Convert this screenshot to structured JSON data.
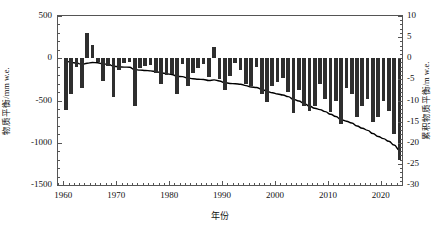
{
  "axes": {
    "left": {
      "label": "物质平衡/mm w.e.",
      "ticks": [
        "500",
        "0",
        "-500",
        "-1000",
        "-1500"
      ],
      "values": [
        500,
        0,
        -500,
        -1000,
        -1500
      ],
      "min": -1500,
      "max": 500
    },
    "right": {
      "label": "累积物质平衡/m w.e.",
      "ticks": [
        "10",
        "5",
        "0",
        "-5",
        "-10",
        "-15",
        "-20",
        "-25",
        "-30"
      ],
      "values": [
        10,
        5,
        0,
        -5,
        -10,
        -15,
        -20,
        -25,
        -30
      ],
      "min": -30,
      "max": 10
    },
    "bottom": {
      "label": "年份",
      "ticks": [
        "1960",
        "1970",
        "1980",
        "1990",
        "2000",
        "2010",
        "2020"
      ],
      "values": [
        1960,
        1970,
        1980,
        1990,
        2000,
        2010,
        2020
      ],
      "min": 1959,
      "max": 2024
    }
  },
  "style": {
    "bar_color": "#2e2e2e",
    "line_color": "#000000",
    "axis_color": "#555555",
    "background": "#ffffff"
  },
  "chart_data": {
    "type": "bar",
    "title": "",
    "subtitle": "",
    "xlabel": "年份",
    "ylabel": "物质平衡/mm w.e.",
    "y2label": "累积物质平衡/m w.e.",
    "xlim": [
      1959,
      2024
    ],
    "ylim": [
      -1500,
      500
    ],
    "y2lim": [
      -30,
      10
    ],
    "grid": false,
    "legend": null,
    "x": [
      1960,
      1961,
      1962,
      1963,
      1964,
      1965,
      1966,
      1967,
      1968,
      1969,
      1970,
      1971,
      1972,
      1973,
      1974,
      1975,
      1976,
      1977,
      1978,
      1979,
      1980,
      1981,
      1982,
      1983,
      1984,
      1985,
      1986,
      1987,
      1988,
      1989,
      1990,
      1991,
      1992,
      1993,
      1994,
      1995,
      1996,
      1997,
      1998,
      1999,
      2000,
      2001,
      2002,
      2003,
      2004,
      2005,
      2006,
      2007,
      2008,
      2009,
      2010,
      2011,
      2012,
      2013,
      2014,
      2015,
      2016,
      2017,
      2018,
      2019,
      2020,
      2021,
      2022,
      2023
    ],
    "series": [
      {
        "name": "物质平衡",
        "type": "bar",
        "unit": "mm w.e.",
        "axis": "left",
        "values": [
          -610,
          -420,
          -100,
          -350,
          300,
          160,
          -50,
          -270,
          -90,
          -460,
          -140,
          -60,
          -40,
          -560,
          -120,
          -90,
          -80,
          -180,
          -300,
          -200,
          -190,
          -420,
          -70,
          -330,
          -180,
          -120,
          -70,
          -220,
          130,
          -250,
          -380,
          -210,
          -60,
          -140,
          -310,
          -330,
          -100,
          -420,
          -520,
          -330,
          -280,
          -230,
          -400,
          -650,
          -370,
          -560,
          -620,
          -560,
          -300,
          -480,
          -640,
          -500,
          -780,
          -350,
          -420,
          -700,
          -560,
          -480,
          -760,
          -700,
          -500,
          -620,
          -900,
          -1200
        ]
      },
      {
        "name": "累积物质平衡",
        "type": "line",
        "unit": "m w.e.",
        "axis": "right",
        "values": [
          -0.61,
          -1.03,
          -1.13,
          -1.48,
          -1.18,
          -1.02,
          -1.07,
          -1.34,
          -1.43,
          -1.89,
          -2.03,
          -2.09,
          -2.13,
          -2.69,
          -2.81,
          -2.9,
          -2.98,
          -3.16,
          -3.46,
          -3.66,
          -3.85,
          -4.27,
          -4.34,
          -4.67,
          -4.85,
          -4.97,
          -5.04,
          -5.26,
          -5.13,
          -5.38,
          -5.76,
          -5.97,
          -6.03,
          -6.17,
          -6.48,
          -6.81,
          -6.91,
          -7.33,
          -7.85,
          -8.18,
          -8.46,
          -8.69,
          -9.09,
          -9.74,
          -10.11,
          -10.67,
          -11.29,
          -11.85,
          -12.15,
          -12.63,
          -13.27,
          -13.77,
          -14.55,
          -14.9,
          -15.32,
          -16.02,
          -16.58,
          -17.06,
          -17.82,
          -18.52,
          -19.02,
          -19.64,
          -20.54,
          -21.74
        ]
      }
    ]
  }
}
